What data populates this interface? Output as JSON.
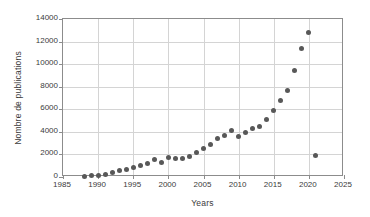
{
  "chart_data": {
    "type": "scatter",
    "title": "",
    "xlabel": "Years",
    "ylabel": "Nombre de publications",
    "xlim": [
      1985,
      2025
    ],
    "ylim": [
      0,
      14000
    ],
    "xticks": [
      1985,
      1990,
      1995,
      2000,
      2005,
      2010,
      2015,
      2020,
      2025
    ],
    "yticks": [
      0,
      2000,
      4000,
      6000,
      8000,
      10000,
      12000,
      14000
    ],
    "grid": true,
    "legend": false,
    "marker_color": "#585858",
    "x": [
      1988,
      1989,
      1990,
      1991,
      1992,
      1993,
      1994,
      1995,
      1996,
      1997,
      1998,
      1999,
      2000,
      2001,
      2002,
      2003,
      2004,
      2005,
      2006,
      2007,
      2008,
      2009,
      2010,
      2011,
      2012,
      2013,
      2014,
      2015,
      2016,
      2017,
      2018,
      2019,
      2020,
      2021
    ],
    "values": [
      60,
      90,
      130,
      260,
      400,
      540,
      640,
      830,
      1000,
      1180,
      1510,
      1300,
      1700,
      1640,
      1650,
      1850,
      2180,
      2550,
      2880,
      3430,
      3650,
      4100,
      3630,
      3900,
      4320,
      4480,
      5060,
      5930,
      6790,
      7650,
      9450,
      11430,
      12830,
      1880
    ],
    "series": [
      {
        "name": "Nombre de publications",
        "values": [
          60,
          90,
          130,
          260,
          400,
          540,
          640,
          830,
          1000,
          1180,
          1510,
          1300,
          1700,
          1640,
          1650,
          1850,
          2180,
          2550,
          2880,
          3430,
          3650,
          4100,
          3630,
          3900,
          4320,
          4480,
          5060,
          5930,
          6790,
          7650,
          9450,
          11430,
          12830,
          1880
        ]
      }
    ]
  },
  "axis": {
    "y_title": "Nombre de publications",
    "x_title": "Years",
    "y_tick_labels": [
      "14000",
      "12000",
      "10000",
      "8000",
      "6000",
      "4000",
      "2000",
      "0"
    ],
    "x_tick_labels": [
      "1985",
      "1990",
      "1995",
      "2000",
      "2005",
      "2010",
      "2015",
      "2020",
      "2025"
    ]
  }
}
